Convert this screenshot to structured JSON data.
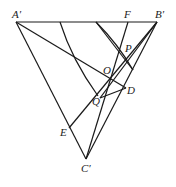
{
  "diagram": {
    "points": {
      "A": {
        "label": "A′",
        "x": 16,
        "y": 22
      },
      "B": {
        "label": "B′",
        "x": 157,
        "y": 22
      },
      "C": {
        "label": "C′",
        "x": 86,
        "y": 159
      },
      "F": {
        "label": "F",
        "x": 128,
        "y": 22
      },
      "P": {
        "label": "P",
        "x": 121,
        "y": 58
      },
      "O": {
        "label": "O",
        "x": 111,
        "y": 77
      },
      "D": {
        "label": "D",
        "x": 126,
        "y": 88
      },
      "Q": {
        "label": "Q",
        "x": 100,
        "y": 98
      },
      "E": {
        "label": "E",
        "x": 69,
        "y": 128
      }
    }
  }
}
